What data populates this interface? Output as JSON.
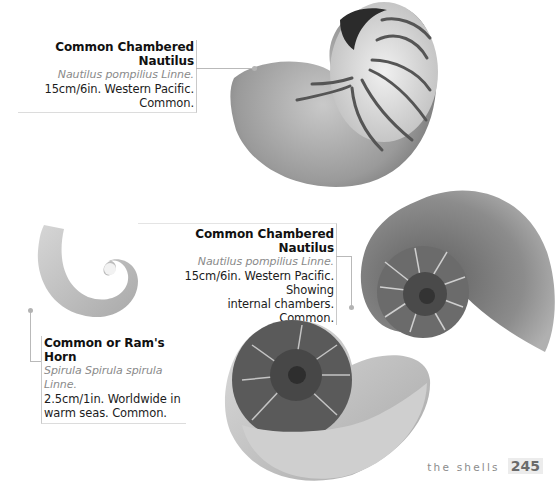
{
  "page": {
    "section_label": "the shells",
    "page_number": "245"
  },
  "entries": [
    {
      "title": "Common Chambered Nautilus",
      "latin": "Nautilus pompilius Linne.",
      "lines": [
        "15cm/6in. Western Pacific.",
        "Common."
      ],
      "image": "whole-nautilus-shell-icon"
    },
    {
      "title": "Common Chambered Nautilus",
      "latin": "Nautilus pompilius Linne.",
      "lines": [
        "15cm/6in. Western Pacific. Showing",
        "internal chambers.",
        "Common."
      ],
      "image": "sectioned-nautilus-shell-icon"
    },
    {
      "title": "Common or Ram's Horn",
      "latin": "Spirula Spirula spirula Linne.",
      "lines": [
        "2.5cm/1in. Worldwide in",
        "warm seas. Common."
      ],
      "image": "rams-horn-shell-icon"
    }
  ],
  "colors": {
    "background": "#ffffff",
    "text": "#1c1c1c",
    "latin": "#8a8a8a",
    "leader": "#b9b9b9"
  }
}
